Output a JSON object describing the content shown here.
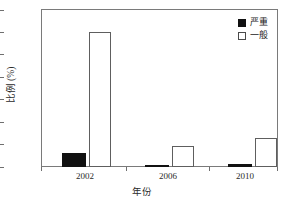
{
  "chart_data": {
    "type": "bar",
    "title": "",
    "categories": [
      "2002",
      "2006",
      "2010"
    ],
    "series": [
      {
        "name": "严重",
        "values": [
          6.2,
          1.0,
          1.3
        ],
        "color": "#111111"
      },
      {
        "name": "一般",
        "values": [
          60.2,
          9.5,
          12.8
        ],
        "color": "#ffffff"
      }
    ],
    "xlabel": "年份",
    "ylabel": "比例 (%)",
    "ylim": [
      0,
      70
    ],
    "yticks": [
      0,
      10,
      20,
      30,
      40,
      50,
      60,
      70
    ],
    "ytick_labels": [
      "0",
      "10",
      "20",
      "30",
      "40",
      "50",
      "60",
      "70"
    ],
    "grid": false,
    "legend_position": "top-right"
  },
  "legend": {
    "items": [
      {
        "label": "严重",
        "swatch": "filled-square"
      },
      {
        "label": "一般",
        "swatch": "open-square"
      }
    ]
  },
  "axes": {
    "y_title": "比例 (%)",
    "x_title": "年份",
    "x_labels": [
      "2002",
      "2006",
      "2010"
    ],
    "y_labels": [
      "70",
      "60",
      "50",
      "40",
      "30",
      "20",
      "10",
      "0"
    ]
  }
}
